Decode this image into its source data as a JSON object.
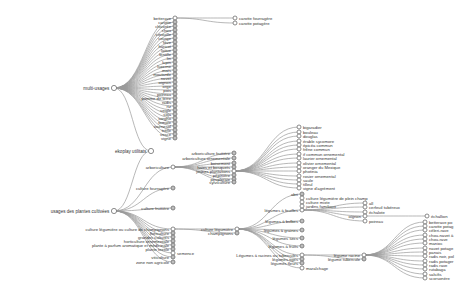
{
  "colors": {
    "collapsed_fill": "#bdbdbd",
    "expanded_fill": "#ffffff",
    "link": "#9a9a9a",
    "stroke": "#6e6e6e"
  },
  "tree": {
    "root": {
      "id": "root",
      "label": "ekoplay utilitats",
      "x": 151,
      "y": 151,
      "expanded": true
    },
    "nodes": [
      {
        "id": "multi",
        "label": "multi-usages",
        "parent": "root",
        "x": 114,
        "y": 88,
        "expanded": true,
        "side": "left"
      },
      {
        "id": "usages",
        "label": "usages des plantes cultivées",
        "parent": "root",
        "x": 114,
        "y": 211,
        "expanded": true,
        "side": "left"
      },
      {
        "id": "m_betterave",
        "label": "betterave",
        "parent": "multi",
        "x": 175,
        "y": 18,
        "expanded": true
      },
      {
        "id": "carotte_f",
        "label": "carotte fourragère",
        "parent": "m_betterave",
        "x": 235,
        "y": 18,
        "expanded": false,
        "side": "right"
      },
      {
        "id": "carotte_p",
        "label": "carotte potagère",
        "parent": "m_betterave",
        "x": 235,
        "y": 23,
        "expanded": false,
        "side": "right"
      },
      {
        "id": "m1",
        "label": "carotte",
        "parent": "multi",
        "x": 175,
        "y": 22
      },
      {
        "id": "m2",
        "label": "chicorée",
        "parent": "multi",
        "x": 175,
        "y": 26
      },
      {
        "id": "m3",
        "label": "chou",
        "parent": "multi",
        "x": 175,
        "y": 30
      },
      {
        "id": "m4",
        "label": "citrouille",
        "parent": "multi",
        "x": 175,
        "y": 34
      },
      {
        "id": "m5",
        "label": "courge",
        "parent": "multi",
        "x": 175,
        "y": 38
      },
      {
        "id": "m6",
        "label": "fève",
        "parent": "multi",
        "x": 175,
        "y": 42
      },
      {
        "id": "m7",
        "label": "haricot",
        "parent": "multi",
        "x": 175,
        "y": 46
      },
      {
        "id": "m8",
        "label": "laitue",
        "parent": "multi",
        "x": 175,
        "y": 50
      },
      {
        "id": "m9",
        "label": "lentille",
        "parent": "multi",
        "x": 175,
        "y": 54
      },
      {
        "id": "m10",
        "label": "lin",
        "parent": "multi",
        "x": 175,
        "y": 58
      },
      {
        "id": "m11",
        "label": "lupin",
        "parent": "multi",
        "x": 175,
        "y": 62
      },
      {
        "id": "m12",
        "label": "luzerne",
        "parent": "multi",
        "x": 175,
        "y": 66
      },
      {
        "id": "m13",
        "label": "maïs",
        "parent": "multi",
        "x": 175,
        "y": 70
      },
      {
        "id": "m14",
        "label": "moutarde",
        "parent": "multi",
        "x": 175,
        "y": 74
      },
      {
        "id": "m15",
        "label": "navet",
        "parent": "multi",
        "x": 175,
        "y": 78
      },
      {
        "id": "m16",
        "label": "oignon",
        "parent": "multi",
        "x": 175,
        "y": 82
      },
      {
        "id": "m17",
        "label": "orge",
        "parent": "multi",
        "x": 175,
        "y": 86
      },
      {
        "id": "m18",
        "label": "pois",
        "parent": "multi",
        "x": 175,
        "y": 90
      },
      {
        "id": "m19",
        "label": "poireau",
        "parent": "multi",
        "x": 175,
        "y": 94
      },
      {
        "id": "m20",
        "label": "pomme de terre",
        "parent": "multi",
        "x": 175,
        "y": 98
      },
      {
        "id": "m21",
        "label": "radis",
        "parent": "multi",
        "x": 175,
        "y": 102
      },
      {
        "id": "m22",
        "label": "riz",
        "parent": "multi",
        "x": 175,
        "y": 106
      },
      {
        "id": "m23",
        "label": "seigle",
        "parent": "multi",
        "x": 175,
        "y": 110
      },
      {
        "id": "m24",
        "label": "soja",
        "parent": "multi",
        "x": 175,
        "y": 114
      },
      {
        "id": "m25",
        "label": "sorgho",
        "parent": "multi",
        "x": 175,
        "y": 118
      },
      {
        "id": "m26",
        "label": "tomate",
        "parent": "multi",
        "x": 175,
        "y": 122
      },
      {
        "id": "m27",
        "label": "tournesol",
        "parent": "multi",
        "x": 175,
        "y": 126
      },
      {
        "id": "m28",
        "label": "trèfle",
        "parent": "multi",
        "x": 175,
        "y": 130
      },
      {
        "id": "m29",
        "label": "vesce",
        "parent": "multi",
        "x": 175,
        "y": 134
      },
      {
        "id": "m30",
        "label": "vigne",
        "parent": "multi",
        "x": 175,
        "y": 138
      },
      {
        "id": "u_arbo",
        "label": "arboriculture",
        "parent": "usages",
        "x": 173,
        "y": 167,
        "expanded": true
      },
      {
        "id": "u_cfour",
        "label": "culture fourragère",
        "parent": "usages",
        "x": 173,
        "y": 188
      },
      {
        "id": "u_cfrui",
        "label": "culture fruitière",
        "parent": "usages",
        "x": 173,
        "y": 208
      },
      {
        "id": "u_cleg",
        "label": "culture légumière ou culture de champignons",
        "parent": "usages",
        "x": 173,
        "y": 229,
        "expanded": true
      },
      {
        "id": "u2",
        "label": "floriculture",
        "parent": "usages",
        "x": 173,
        "y": 233
      },
      {
        "id": "u3",
        "label": "grandes cultures",
        "parent": "usages",
        "x": 173,
        "y": 237
      },
      {
        "id": "u4",
        "label": "horticulture ornementale",
        "parent": "usages",
        "x": 173,
        "y": 241
      },
      {
        "id": "u5",
        "label": "plante à parfum aromatique et médicinale",
        "parent": "usages",
        "x": 173,
        "y": 245
      },
      {
        "id": "u6",
        "label": "plante textile",
        "parent": "usages",
        "x": 173,
        "y": 249
      },
      {
        "id": "u_sem",
        "label": "semence",
        "parent": "usages",
        "x": 173,
        "y": 253,
        "side": "right"
      },
      {
        "id": "u7",
        "label": "viticulture",
        "parent": "usages",
        "x": 173,
        "y": 257
      },
      {
        "id": "u8",
        "label": "zone non agricole",
        "parent": "usages",
        "x": 173,
        "y": 262
      },
      {
        "id": "a1",
        "label": "arboriculture fruitière",
        "parent": "u_arbo",
        "x": 234,
        "y": 153
      },
      {
        "id": "a2",
        "label": "arboriculture ornementale",
        "parent": "u_arbo",
        "x": 234,
        "y": 158
      },
      {
        "id": "a3",
        "label": "boisement",
        "parent": "u_arbo",
        "x": 234,
        "y": 163
      },
      {
        "id": "a4",
        "label": "haies et bosquets",
        "parent": "u_arbo",
        "x": 234,
        "y": 167
      },
      {
        "id": "a5",
        "label": "jeunes plantations",
        "parent": "u_arbo",
        "x": 234,
        "y": 171,
        "expanded": true
      },
      {
        "id": "a6",
        "label": "pépinière",
        "parent": "u_arbo",
        "x": 234,
        "y": 175
      },
      {
        "id": "a7",
        "label": "peupleraie",
        "parent": "u_arbo",
        "x": 234,
        "y": 179
      },
      {
        "id": "a8",
        "label": "sylviculture",
        "parent": "u_arbo",
        "x": 234,
        "y": 182
      },
      {
        "id": "j1",
        "label": "bigaradier",
        "parent": "a5",
        "x": 299,
        "y": 127,
        "side": "right"
      },
      {
        "id": "j2",
        "label": "bouleau",
        "parent": "a5",
        "x": 299,
        "y": 132,
        "side": "right"
      },
      {
        "id": "j3",
        "label": "douglas",
        "parent": "a5",
        "x": 299,
        "y": 136,
        "side": "right"
      },
      {
        "id": "j4",
        "label": "érable sycomore",
        "parent": "a5",
        "x": 299,
        "y": 141,
        "side": "right"
      },
      {
        "id": "j5",
        "label": "épicéa commun",
        "parent": "a5",
        "x": 299,
        "y": 145,
        "side": "right"
      },
      {
        "id": "j6",
        "label": "frêne commun",
        "parent": "a5",
        "x": 299,
        "y": 149,
        "side": "right"
      },
      {
        "id": "j7",
        "label": "if commun ornemental",
        "parent": "a5",
        "x": 299,
        "y": 154,
        "side": "right"
      },
      {
        "id": "j8",
        "label": "laurier ornemental",
        "parent": "a5",
        "x": 299,
        "y": 158,
        "side": "right"
      },
      {
        "id": "j9",
        "label": "olivier ornemental",
        "parent": "a5",
        "x": 299,
        "y": 163,
        "side": "right"
      },
      {
        "id": "j10",
        "label": "oranger du Mexique",
        "parent": "a5",
        "x": 299,
        "y": 167,
        "side": "right"
      },
      {
        "id": "j11",
        "label": "photinia",
        "parent": "a5",
        "x": 299,
        "y": 171,
        "side": "right"
      },
      {
        "id": "j12",
        "label": "rosier ornemental",
        "parent": "a5",
        "x": 299,
        "y": 176,
        "side": "right"
      },
      {
        "id": "j13",
        "label": "saule",
        "parent": "a5",
        "x": 299,
        "y": 180,
        "side": "right"
      },
      {
        "id": "j14",
        "label": "tilleul",
        "parent": "a5",
        "x": 299,
        "y": 184,
        "side": "right"
      },
      {
        "id": "j15",
        "label": "vigne d'agrément",
        "parent": "a5",
        "x": 299,
        "y": 188,
        "side": "right"
      },
      {
        "id": "cl1",
        "label": "culture légumière",
        "parent": "u_cleg",
        "x": 237,
        "y": 229,
        "expanded": true
      },
      {
        "id": "cl2",
        "label": "champignons",
        "parent": "u_cleg",
        "x": 237,
        "y": 233
      },
      {
        "id": "lg0",
        "label": "abri",
        "parent": "cl1",
        "x": 302,
        "y": 194
      },
      {
        "id": "lg1",
        "label": "légumes à feuilles",
        "parent": "cl1",
        "x": 302,
        "y": 210,
        "expanded": true
      },
      {
        "id": "lg2",
        "label": "légumes à bulbes",
        "parent": "cl1",
        "x": 302,
        "y": 221
      },
      {
        "id": "lg3",
        "label": "légumes à graines",
        "parent": "cl1",
        "x": 302,
        "y": 230
      },
      {
        "id": "lg4",
        "label": "légumes secs",
        "parent": "cl1",
        "x": 302,
        "y": 238
      },
      {
        "id": "lg5",
        "label": "légumes à fruits",
        "parent": "cl1",
        "x": 302,
        "y": 246
      },
      {
        "id": "lg6",
        "label": "Légumes à racines ou tubercules",
        "parent": "cl1",
        "x": 302,
        "y": 255,
        "expanded": true
      },
      {
        "id": "lg7",
        "label": "légumes tiges",
        "parent": "cl1",
        "x": 302,
        "y": 259
      },
      {
        "id": "lg8",
        "label": "légumes fleurs",
        "parent": "cl1",
        "x": 302,
        "y": 263
      },
      {
        "id": "lg9",
        "label": "maraîchage",
        "parent": "cl1",
        "x": 302,
        "y": 268,
        "side": "right"
      },
      {
        "id": "f1",
        "label": "culture légumière de plein champ",
        "parent": "lg1",
        "x": 302,
        "y": 198,
        "side": "right"
      },
      {
        "id": "f2",
        "label": "culture mixte",
        "parent": "lg1",
        "x": 302,
        "y": 202,
        "side": "right"
      },
      {
        "id": "f3",
        "label": "jardins familiaux",
        "parent": "lg1",
        "x": 302,
        "y": 206,
        "side": "right"
      },
      {
        "id": "f_all",
        "label": "all",
        "parent": "lg1",
        "x": 365,
        "y": 203,
        "side": "right"
      },
      {
        "id": "f_tub",
        "label": "cerfeuil tubéreux",
        "parent": "lg1",
        "x": 365,
        "y": 207,
        "side": "right"
      },
      {
        "id": "f_ech",
        "label": "échalote",
        "parent": "lg1",
        "x": 365,
        "y": 212,
        "side": "right"
      },
      {
        "id": "f_oig",
        "label": "oignon",
        "parent": "lg1",
        "x": 365,
        "y": 216,
        "expanded": true
      },
      {
        "id": "f_poi",
        "label": "poireau",
        "parent": "lg1",
        "x": 365,
        "y": 221,
        "side": "right"
      },
      {
        "id": "f_ech2",
        "label": "échallion",
        "parent": "f_oig",
        "x": 427,
        "y": 216,
        "side": "right"
      },
      {
        "id": "r1",
        "label": "légume racine",
        "parent": "lg6",
        "x": 364,
        "y": 255,
        "expanded": true
      },
      {
        "id": "r2",
        "label": "légume tubercule",
        "parent": "lg6",
        "x": 364,
        "y": 259
      },
      {
        "id": "rr1",
        "label": "betterave po",
        "parent": "r1",
        "x": 425,
        "y": 222,
        "side": "right"
      },
      {
        "id": "rr2",
        "label": "carotte potag",
        "parent": "r1",
        "x": 425,
        "y": 226,
        "side": "right"
      },
      {
        "id": "rr3",
        "label": "céleri-rave",
        "parent": "r1",
        "x": 425,
        "y": 230,
        "side": "right"
      },
      {
        "id": "rr4",
        "label": "chou-navet à",
        "parent": "r1",
        "x": 425,
        "y": 235,
        "side": "right"
      },
      {
        "id": "rr5",
        "label": "chou-rave",
        "parent": "r1",
        "x": 425,
        "y": 239,
        "side": "right"
      },
      {
        "id": "rr6",
        "label": "manioc",
        "parent": "r1",
        "x": 425,
        "y": 243,
        "side": "right"
      },
      {
        "id": "rr7",
        "label": "navet potage",
        "parent": "r1",
        "x": 425,
        "y": 248,
        "side": "right"
      },
      {
        "id": "rr8",
        "label": "panais",
        "parent": "r1",
        "x": 425,
        "y": 252,
        "side": "right"
      },
      {
        "id": "rr9",
        "label": "radis noir, pol",
        "parent": "r1",
        "x": 425,
        "y": 256,
        "side": "right"
      },
      {
        "id": "rr10",
        "label": "radis potager",
        "parent": "r1",
        "x": 425,
        "y": 261,
        "side": "right"
      },
      {
        "id": "rr11",
        "label": "radis rave",
        "parent": "r1",
        "x": 425,
        "y": 265,
        "side": "right"
      },
      {
        "id": "rr12",
        "label": "rutabaga",
        "parent": "r1",
        "x": 425,
        "y": 269,
        "side": "right"
      },
      {
        "id": "rr13",
        "label": "salsifis",
        "parent": "r1",
        "x": 425,
        "y": 274,
        "side": "right"
      },
      {
        "id": "rr14",
        "label": "scorsonère",
        "parent": "r1",
        "x": 425,
        "y": 278,
        "side": "right"
      }
    ]
  }
}
